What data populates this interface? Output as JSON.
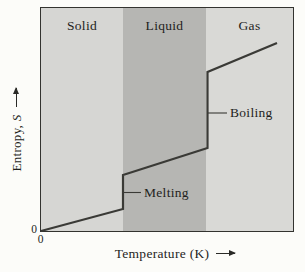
{
  "chart_data": {
    "type": "line",
    "title": "",
    "xlabel": "Temperature (K)",
    "ylabel_prefix": "Entropy, ",
    "ylabel_symbol": "S",
    "origin_y_label": "0",
    "origin_x_label": "0",
    "axes": {
      "x_ticks": [
        "0"
      ],
      "y_ticks": [
        "0"
      ],
      "grid": false,
      "note": "qualitative schematic axes with arrowheads, no numeric scale"
    },
    "regions": [
      {
        "label": "Solid",
        "x_px": [
          0,
          82
        ],
        "color": "#d6d6d3"
      },
      {
        "label": "Liquid",
        "x_px": [
          82,
          165
        ],
        "color": "#b6b6b3"
      },
      {
        "label": "Gas",
        "x_px": [
          165,
          252
        ],
        "color": "#d9d9d6"
      }
    ],
    "curve_points_px": [
      [
        0,
        223
      ],
      [
        82,
        201
      ],
      [
        82,
        167
      ],
      [
        166.5,
        140
      ],
      [
        166.5,
        64
      ],
      [
        236,
        35
      ]
    ],
    "points_normalized": [
      [
        0,
        0
      ],
      [
        0.33,
        0.1
      ],
      [
        0.33,
        0.25
      ],
      [
        0.66,
        0.37
      ],
      [
        0.66,
        0.71
      ],
      [
        0.94,
        0.84
      ]
    ],
    "annotations": [
      {
        "label": "Melting",
        "tick": {
          "x1": 82,
          "y1": 184.5,
          "x2": 100,
          "y2": 184.5
        },
        "label_pos": {
          "left": 103,
          "top": 184.5
        }
      },
      {
        "label": "Boiling",
        "tick": {
          "x1": 166.5,
          "y1": 105,
          "x2": 186,
          "y2": 105
        },
        "label_pos": {
          "left": 189,
          "top": 105
        }
      }
    ],
    "colors": {
      "curve": "#3a3a36",
      "plot_border": "#33332f",
      "text": "#1f1f1d",
      "page_background": "#fcfcf9"
    }
  }
}
